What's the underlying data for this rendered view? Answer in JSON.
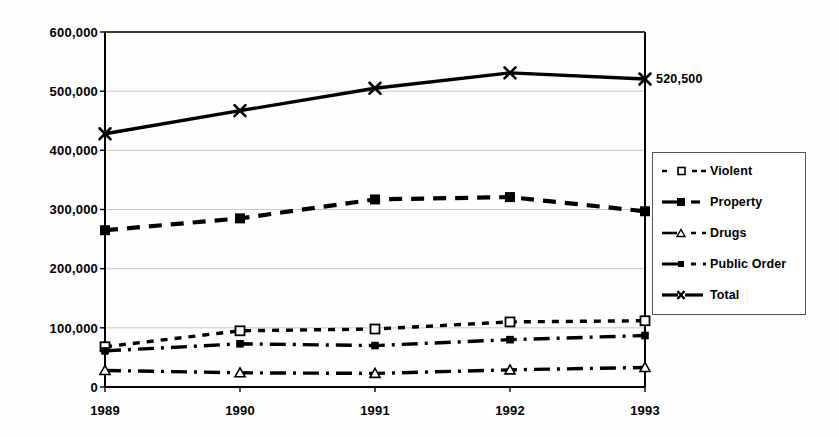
{
  "chart_data": {
    "type": "line",
    "title": "",
    "xlabel": "",
    "ylabel": "",
    "categories": [
      "1989",
      "1990",
      "1991",
      "1992",
      "1993"
    ],
    "ylim": [
      0,
      600000
    ],
    "ytick_labels": [
      "0",
      "100,000",
      "200,000",
      "300,000",
      "400,000",
      "500,000",
      "600,000"
    ],
    "ytick_values": [
      0,
      100000,
      200000,
      300000,
      400000,
      500000,
      600000
    ],
    "grid": true,
    "legend_position": "right",
    "series": [
      {
        "name": "Violent",
        "marker": "open-square",
        "dash": "dotted",
        "values": [
          68000,
          95000,
          98000,
          110000,
          112000
        ]
      },
      {
        "name": "Property",
        "marker": "filled-square",
        "dash": "dashed",
        "values": [
          265000,
          285000,
          317000,
          321000,
          297000
        ]
      },
      {
        "name": "Drugs",
        "marker": "open-triangle",
        "dash": "dash-dot",
        "values": [
          28000,
          24000,
          23000,
          29000,
          33000
        ]
      },
      {
        "name": "Public Order",
        "marker": "small-filled-square",
        "dash": "dash-dot",
        "values": [
          61000,
          73000,
          70000,
          80000,
          87000
        ]
      },
      {
        "name": "Total",
        "marker": "cross-x",
        "dash": "solid",
        "values": [
          428000,
          467000,
          505000,
          531000,
          520500
        ]
      }
    ],
    "annotations": [
      {
        "text": "520,500",
        "series": "Total",
        "category": "1993"
      }
    ],
    "colors": {
      "line": "#000000",
      "grid": "#c8c8c8",
      "axis": "#000000",
      "background": "#ffffff"
    }
  },
  "legend": {
    "items": [
      {
        "label": "Violent"
      },
      {
        "label": "Property"
      },
      {
        "label": "Drugs"
      },
      {
        "label": "Public Order"
      },
      {
        "label": "Total"
      }
    ]
  },
  "axes": {
    "y_labels": [
      "600,000",
      "500,000",
      "400,000",
      "300,000",
      "200,000",
      "100,000",
      "0"
    ],
    "x_labels": [
      "1989",
      "1990",
      "1991",
      "1992",
      "1993"
    ]
  },
  "annotation_label": "520,500"
}
